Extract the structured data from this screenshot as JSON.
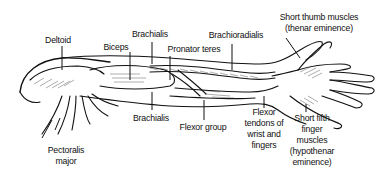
{
  "diagram": {
    "labels": [
      {
        "id": "deltoid",
        "lines": [
          "Deltoid"
        ]
      },
      {
        "id": "biceps",
        "lines": [
          "Biceps"
        ]
      },
      {
        "id": "brachialis-top",
        "lines": [
          "Brachialis"
        ]
      },
      {
        "id": "pronator-teres",
        "lines": [
          "Pronator teres"
        ]
      },
      {
        "id": "brachioradialis",
        "lines": [
          "Brachioradialis"
        ]
      },
      {
        "id": "thenar",
        "lines": [
          "Short thumb muscles",
          "(thenar eminence)"
        ]
      },
      {
        "id": "pectoralis",
        "lines": [
          "Pectoralis",
          "major"
        ]
      },
      {
        "id": "brachialis-bottom",
        "lines": [
          "Brachialis"
        ]
      },
      {
        "id": "flexor-group",
        "lines": [
          "Flexor group"
        ]
      },
      {
        "id": "flexor-tendons",
        "lines": [
          "Flexor",
          "tendons of",
          "wrist and",
          "fingers"
        ]
      },
      {
        "id": "hypothenar",
        "lines": [
          "Short fifth",
          "finger",
          "muscles",
          "(hypothenar",
          "eminence)"
        ]
      }
    ],
    "colors": {
      "ink": "#111111",
      "background": "#ffffff"
    }
  }
}
